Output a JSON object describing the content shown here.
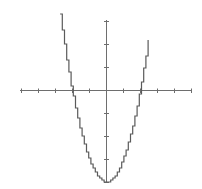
{
  "chart_data": {
    "type": "line",
    "title": "",
    "xlabel": "",
    "ylabel": "",
    "function": "y = x^2 - 4",
    "style": "stair-step rendering of a parabola",
    "x": [
      -2.7,
      -2.5,
      -2.0,
      -1.5,
      -1.0,
      -0.5,
      0.0,
      0.5,
      1.0,
      1.5,
      2.0,
      2.5,
      2.6
    ],
    "series": [
      {
        "name": "y = x^2 - 4",
        "values": [
          3.29,
          2.25,
          0.0,
          -1.75,
          -3.0,
          -3.75,
          -4.0,
          -3.75,
          -3.0,
          -1.75,
          0.0,
          2.25,
          2.76
        ]
      }
    ],
    "xlim": [
      -5,
      5
    ],
    "ylim": [
      -4,
      3
    ],
    "x_ticks": [
      -5,
      -4,
      -3,
      -2,
      -1,
      0,
      1,
      2,
      3,
      4,
      5
    ],
    "y_ticks": [
      -4,
      -3,
      -2,
      -1,
      0,
      1,
      2,
      3
    ],
    "tick_labels_shown": false,
    "grid": false,
    "legend": "none",
    "roots": [
      -2,
      2
    ],
    "vertex": [
      0,
      -4
    ],
    "colors": {
      "axis": "#6e6e6e",
      "curve": "#5a5a5a",
      "background": "#ffffff"
    }
  },
  "layout": {
    "origin_px": [
      106,
      90
    ],
    "x_unit_px": 17,
    "y_unit_px": 23
  }
}
